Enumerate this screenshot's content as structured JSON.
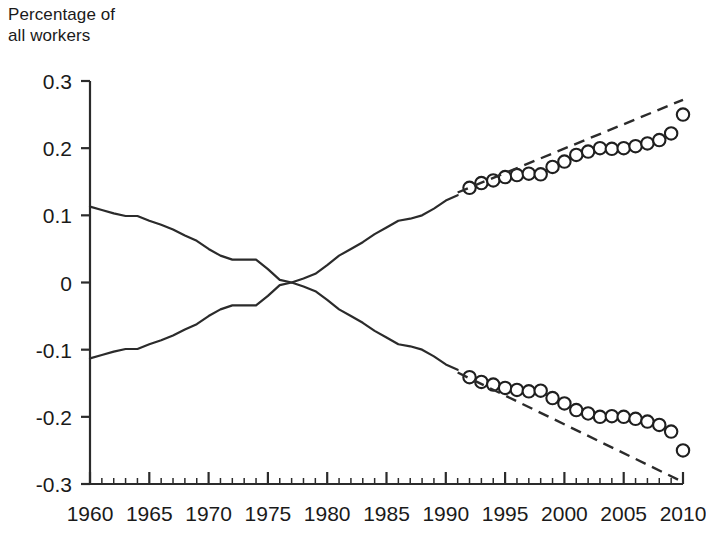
{
  "chart_data": {
    "type": "line",
    "title": "Percentage of\nall workers",
    "ylabel": "Percentage of all workers",
    "xlabel": "",
    "xlim": [
      1960,
      2010
    ],
    "ylim": [
      -0.3,
      0.3
    ],
    "grid": false,
    "legend": "none",
    "y_ticks": [
      0.3,
      0.2,
      0.1,
      0,
      -0.1,
      -0.2,
      -0.3
    ],
    "y_tick_labels": [
      "0.3",
      "0.2",
      "0.1",
      "0",
      "-0.1",
      "-0.2",
      "-0.3"
    ],
    "x_ticks": [
      1960,
      1965,
      1970,
      1975,
      1980,
      1985,
      1990,
      1995,
      2000,
      2005,
      2010
    ],
    "x_tick_labels": [
      "1960",
      "1965",
      "1970",
      "1975",
      "1980",
      "1985",
      "1990",
      "1995",
      "2000",
      "2005",
      "2010"
    ],
    "x_minor_tick_interval": 1,
    "series": [
      {
        "name": "upper-historical-line",
        "style": "solid",
        "x": [
          1960,
          1961,
          1962,
          1963,
          1964,
          1965,
          1966,
          1967,
          1968,
          1969,
          1970,
          1971,
          1972,
          1973,
          1974,
          1975,
          1976,
          1977,
          1978,
          1979,
          1980,
          1981,
          1982,
          1983,
          1984,
          1985,
          1986,
          1987,
          1988,
          1989,
          1990,
          1991
        ],
        "values": [
          0.113,
          0.108,
          0.103,
          0.099,
          0.099,
          0.092,
          0.086,
          0.079,
          0.07,
          0.062,
          0.05,
          0.04,
          0.034,
          0.034,
          0.034,
          0.02,
          0.004,
          0.0,
          0.006,
          0.013,
          0.026,
          0.04,
          0.05,
          0.06,
          0.072,
          0.082,
          0.092,
          0.095,
          0.1,
          0.11,
          0.122,
          0.13
        ]
      },
      {
        "name": "lower-historical-line",
        "style": "solid",
        "x": [
          1960,
          1961,
          1962,
          1963,
          1964,
          1965,
          1966,
          1967,
          1968,
          1969,
          1970,
          1971,
          1972,
          1973,
          1974,
          1975,
          1976,
          1977,
          1978,
          1979,
          1980,
          1981,
          1982,
          1983,
          1984,
          1985,
          1986,
          1987,
          1988,
          1989,
          1990,
          1991
        ],
        "values": [
          -0.113,
          -0.108,
          -0.103,
          -0.099,
          -0.099,
          -0.092,
          -0.086,
          -0.079,
          -0.07,
          -0.062,
          -0.05,
          -0.04,
          -0.034,
          -0.034,
          -0.034,
          -0.02,
          -0.004,
          0.0,
          -0.006,
          -0.013,
          -0.026,
          -0.04,
          -0.05,
          -0.06,
          -0.072,
          -0.082,
          -0.092,
          -0.095,
          -0.1,
          -0.11,
          -0.122,
          -0.13
        ]
      },
      {
        "name": "upper-observed-markers",
        "style": "open-circles",
        "x": [
          1992,
          1993,
          1994,
          1995,
          1996,
          1997,
          1998,
          1999,
          2000,
          2001,
          2002,
          2003,
          2004,
          2005,
          2006,
          2007,
          2008,
          2009,
          2010
        ],
        "values": [
          0.141,
          0.148,
          0.152,
          0.157,
          0.16,
          0.162,
          0.161,
          0.172,
          0.18,
          0.19,
          0.195,
          0.2,
          0.199,
          0.2,
          0.203,
          0.207,
          0.212,
          0.222,
          0.25
        ]
      },
      {
        "name": "lower-observed-markers",
        "style": "open-circles",
        "x": [
          1992,
          1993,
          1994,
          1995,
          1996,
          1997,
          1998,
          1999,
          2000,
          2001,
          2002,
          2003,
          2004,
          2005,
          2006,
          2007,
          2008,
          2009,
          2010
        ],
        "values": [
          -0.141,
          -0.148,
          -0.152,
          -0.157,
          -0.16,
          -0.162,
          -0.161,
          -0.172,
          -0.18,
          -0.19,
          -0.195,
          -0.2,
          -0.199,
          -0.2,
          -0.203,
          -0.207,
          -0.212,
          -0.222,
          -0.25
        ]
      },
      {
        "name": "upper-trend-extrapolation",
        "style": "dashed",
        "x": [
          1991,
          2010
        ],
        "values": [
          0.134,
          0.272
        ]
      },
      {
        "name": "lower-trend-extrapolation",
        "style": "dashed",
        "x": [
          1991,
          2010
        ],
        "values": [
          -0.134,
          -0.297
        ]
      }
    ]
  },
  "axis": {
    "title_line1": "Percentage of",
    "title_line2": "all workers"
  }
}
